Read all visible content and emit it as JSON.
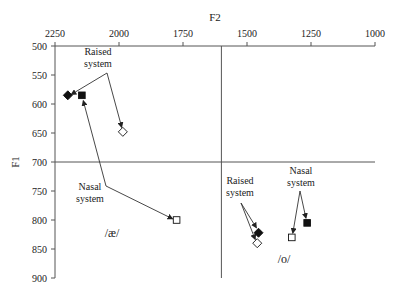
{
  "chart_data": {
    "type": "scatter",
    "title": "",
    "xlabel": "F2",
    "ylabel": "F1",
    "x_axis_position": "top",
    "x_reversed": true,
    "y_reversed": true,
    "xlim": [
      2250,
      1000
    ],
    "ylim": [
      500,
      900
    ],
    "x_ticks": [
      2250,
      2000,
      1750,
      1500,
      1250,
      1000
    ],
    "y_ticks": [
      500,
      550,
      600,
      650,
      700,
      750,
      800,
      850,
      900
    ],
    "grid": false,
    "reference_lines": [
      {
        "orientation": "vertical",
        "value": 1600
      },
      {
        "orientation": "horizontal",
        "value": 700
      }
    ],
    "series": [
      {
        "name": "/æ/ filled diamond",
        "marker": "diamond",
        "filled": true,
        "points": [
          {
            "F2": 2200,
            "F1": 585
          }
        ]
      },
      {
        "name": "/æ/ filled square",
        "marker": "square",
        "filled": true,
        "points": [
          {
            "F2": 2145,
            "F1": 585
          }
        ]
      },
      {
        "name": "/æ/ open diamond",
        "marker": "diamond",
        "filled": false,
        "points": [
          {
            "F2": 1985,
            "F1": 648
          }
        ]
      },
      {
        "name": "/æ/ open square",
        "marker": "square",
        "filled": false,
        "points": [
          {
            "F2": 1775,
            "F1": 800
          }
        ]
      },
      {
        "name": "/o/ filled diamond",
        "marker": "diamond",
        "filled": true,
        "points": [
          {
            "F2": 1455,
            "F1": 822
          }
        ]
      },
      {
        "name": "/o/ open diamond",
        "marker": "diamond",
        "filled": false,
        "points": [
          {
            "F2": 1460,
            "F1": 840
          }
        ]
      },
      {
        "name": "/o/ open square",
        "marker": "square",
        "filled": false,
        "points": [
          {
            "F2": 1325,
            "F1": 830
          }
        ]
      },
      {
        "name": "/o/ filled square",
        "marker": "square",
        "filled": true,
        "points": [
          {
            "F2": 1265,
            "F1": 805
          }
        ]
      }
    ],
    "annotations": [
      {
        "text_lines": [
          "Raised",
          "system"
        ],
        "x": 98,
        "y": 55,
        "arrows_to": [
          [
            67,
            97
          ],
          [
            123,
            132
          ]
        ],
        "arrow_from": [
          107,
          73
        ]
      },
      {
        "text_lines": [
          "Nasal",
          "system"
        ],
        "x": 90,
        "y": 190,
        "arrows_to": [
          [
            82,
            96
          ],
          [
            177,
            221
          ]
        ],
        "arrow_from": [
          106,
          186
        ]
      },
      {
        "text_lines": [
          "Raised",
          "system"
        ],
        "x": 240,
        "y": 184,
        "arrows_to": [
          [
            259,
            232
          ],
          [
            257,
            244
          ]
        ],
        "arrow_from": [
          241,
          203
        ]
      },
      {
        "text_lines": [
          "Nasal",
          "system"
        ],
        "x": 301,
        "y": 174,
        "arrows_to": [
          [
            292,
            238
          ],
          [
            307,
            223
          ]
        ],
        "arrow_from": [
          300,
          191
        ]
      }
    ],
    "vowel_labels": [
      {
        "text": "/æ/",
        "x": 112,
        "y": 237
      },
      {
        "text": "/o/",
        "x": 284,
        "y": 263
      }
    ]
  }
}
